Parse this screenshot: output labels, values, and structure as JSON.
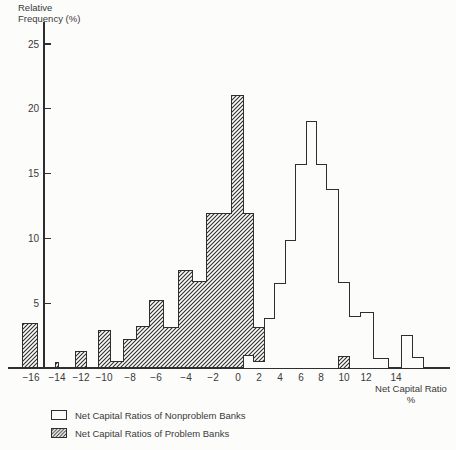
{
  "chart_data": {
    "type": "bar",
    "title": "",
    "ylabel": "Relative Frequency (%)",
    "ylabel_lines": [
      "Relative",
      "Frequency (%)"
    ],
    "xlabel": "Net Capital Ratio %",
    "xlabel_lines": [
      "Net Capital Ratio",
      "%"
    ],
    "y_ticks": [
      5,
      10,
      15,
      20,
      25
    ],
    "x_ticks": [
      -16,
      -14,
      -12,
      -10,
      -8,
      -6,
      -4,
      -2,
      0,
      2,
      4,
      6,
      8,
      10,
      12,
      14
    ],
    "ylim": [
      0,
      27
    ],
    "xlim": [
      -17.5,
      17.5
    ],
    "grid": "off",
    "legend_position": "bottom-left",
    "legend": [
      {
        "label": "Net Capital Ratios of Nonproblem Banks",
        "style": "open"
      },
      {
        "label": "Net Capital Ratios of Problem Banks",
        "style": "hatched"
      }
    ],
    "series": [
      {
        "name": "Net Capital Ratios of Problem Banks",
        "style": "hatched",
        "bars": [
          {
            "x": -16,
            "h": 3.4
          },
          {
            "x": -14,
            "h": 0.4,
            "w": 0.2
          },
          {
            "x": -12,
            "h": 1.3
          },
          {
            "x": -10,
            "h": 2.9
          },
          {
            "x": -9,
            "h": 0.5
          },
          {
            "x": -8,
            "h": 2.2
          },
          {
            "x": -7,
            "h": 3.2
          },
          {
            "x": -6,
            "h": 5.2
          },
          {
            "x": -5,
            "h": 3.1
          },
          {
            "x": -4,
            "h": 7.5
          },
          {
            "x": -3,
            "h": 6.7
          },
          {
            "x": -2,
            "h": 11.9
          },
          {
            "x": -1,
            "h": 11.9
          },
          {
            "x": 0,
            "h": 21
          },
          {
            "x": 1,
            "h": 11.9
          },
          {
            "x": 2,
            "h": 3.1
          },
          {
            "x": 3,
            "h": 3.1
          },
          {
            "x": 4,
            "h": 1.6
          },
          {
            "x": 5,
            "h": 1.6
          },
          {
            "x": 6,
            "h": 0.9
          },
          {
            "x": 10,
            "h": 0.9,
            "front": true
          }
        ]
      },
      {
        "name": "Net Capital Ratios of Nonproblem Banks",
        "style": "open",
        "bars": [
          {
            "x": 1,
            "h": 1.0
          },
          {
            "x": 2,
            "h": 0.5
          },
          {
            "x": 3,
            "h": 3.8
          },
          {
            "x": 4,
            "h": 6.5
          },
          {
            "x": 5,
            "h": 9.8
          },
          {
            "x": 6,
            "h": 15.7
          },
          {
            "x": 7,
            "h": 19
          },
          {
            "x": 8,
            "h": 15.7
          },
          {
            "x": 9,
            "h": 13.8
          },
          {
            "x": 10,
            "h": 6.6
          },
          {
            "x": 11,
            "h": 4.0
          },
          {
            "x": 12,
            "h": 4.3
          },
          {
            "x": 13,
            "h": 0.7
          },
          {
            "x": 15,
            "h": 2.5
          },
          {
            "x": 16,
            "h": 0.8
          }
        ]
      }
    ],
    "colors": {
      "ink": "#3a3a3a",
      "line": "#2e2e2e",
      "background": "#fcfcfa",
      "bar_fill": "#fcfcfa"
    }
  }
}
